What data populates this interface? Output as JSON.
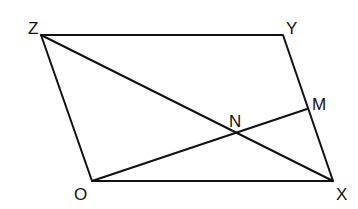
{
  "diagram": {
    "type": "parallelogram",
    "points": {
      "Z": {
        "label": "Z",
        "x": 41,
        "y": 35
      },
      "Y": {
        "label": "Y",
        "x": 283,
        "y": 35
      },
      "X": {
        "label": "X",
        "x": 333,
        "y": 181
      },
      "O": {
        "label": "O",
        "x": 92,
        "y": 181
      },
      "M": {
        "label": "M",
        "x": 307,
        "y": 109
      },
      "N": {
        "label": "N",
        "x": 236,
        "y": 133
      }
    },
    "segments": [
      "ZY",
      "YX",
      "XO",
      "OZ",
      "ZX",
      "OM"
    ],
    "stroke_color": "#111111"
  }
}
